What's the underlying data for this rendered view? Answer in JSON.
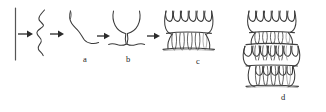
{
  "figure": {
    "background_color": "#ffffff",
    "line_color": "#3a3a3a",
    "width": 326,
    "height": 112
  },
  "stages": [
    {
      "id": "wall",
      "name": "substrate-wall",
      "label": "",
      "description": "vertical surface line at far left"
    },
    {
      "id": "coil",
      "name": "random-coil-chain",
      "label": "",
      "description": "single random coil polymer chain, vertical serpentine"
    },
    {
      "id": "a",
      "name": "extended-chain",
      "label": "a",
      "label_x": 83,
      "label_y": 58,
      "description": "extended / partially stretched single chain"
    },
    {
      "id": "b",
      "name": "folded-nucleus",
      "label": "b",
      "label_x": 126,
      "label_y": 58,
      "description": "first chain fold forming a narrow necked nucleus"
    },
    {
      "id": "c",
      "name": "single-lamella",
      "label": "c",
      "label_x": 196,
      "label_y": 60,
      "description": "single chain-folded lamella on substrate with six hairpin folds",
      "fold_count": 6
    },
    {
      "id": "d",
      "name": "stacked-lamellae",
      "label": "d",
      "label_x": 281,
      "label_y": 96,
      "description": "three stacked chain-folded lamellae",
      "layer_count": 3,
      "fold_count": 6
    }
  ],
  "arrows": [
    {
      "name": "arrow-1",
      "from": "wall",
      "to": "coil",
      "x": 17,
      "y": 34,
      "length": 15
    },
    {
      "name": "arrow-2",
      "from": "coil",
      "to": "a",
      "x": 49,
      "y": 34,
      "length": 15
    },
    {
      "name": "arrow-3",
      "from": "a",
      "to": "b",
      "x": 96,
      "y": 36,
      "length": 15
    },
    {
      "name": "arrow-4",
      "from": "b",
      "to": "c",
      "x": 146,
      "y": 36,
      "length": 15
    }
  ]
}
